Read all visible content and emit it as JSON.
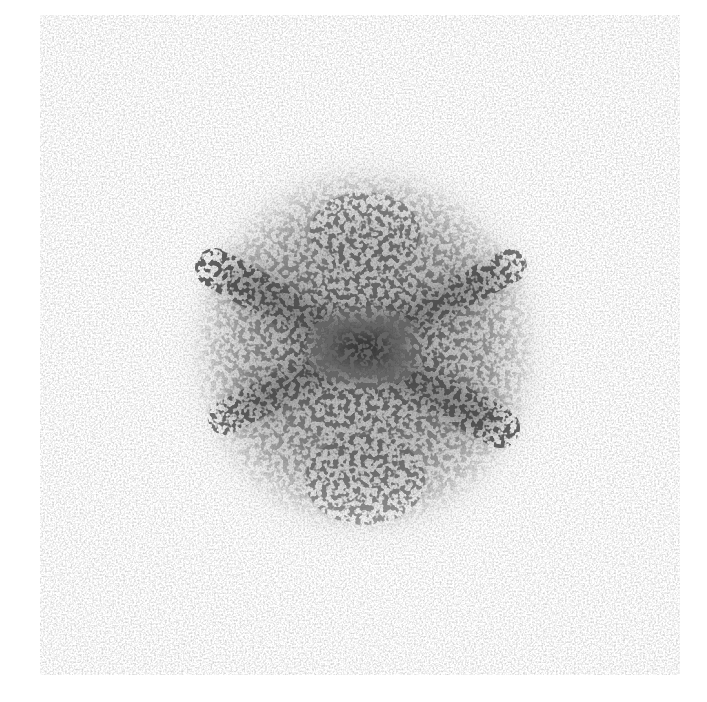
{
  "image": {
    "description": "Grayscale speckle scattering/diffraction pattern with a dense central blob and an X-shaped streak",
    "background_color": "#ffffff",
    "ink_color": "#1e1e1e",
    "center": {
      "x": 365,
      "y": 350
    },
    "blob": {
      "rx": 150,
      "ry": 160
    },
    "streaks": [
      {
        "name": "upper-left-to-lower-right",
        "x1": 220,
        "y1": 270,
        "x2": 495,
        "y2": 425,
        "width": 34
      },
      {
        "name": "lower-left-to-upper-right",
        "x1": 230,
        "y1": 415,
        "x2": 505,
        "y2": 270,
        "width": 30
      }
    ],
    "text_labels": []
  }
}
